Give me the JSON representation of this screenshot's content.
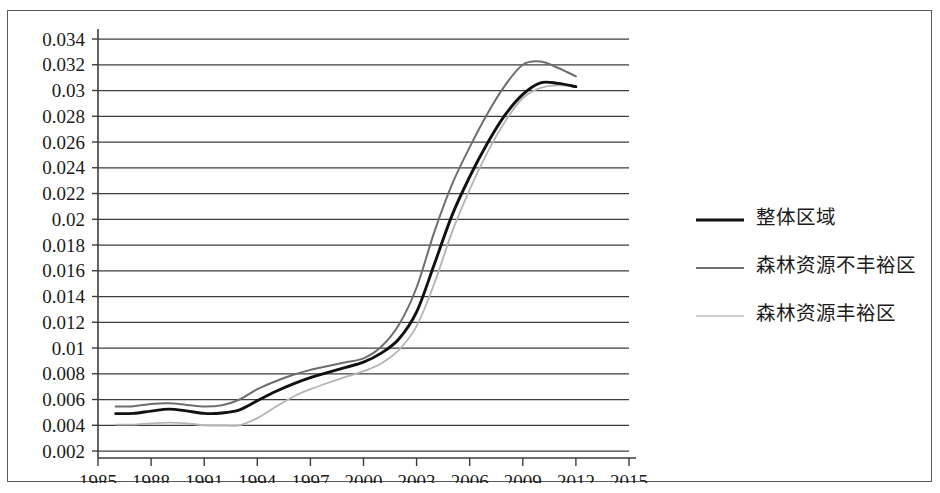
{
  "chart_data": {
    "type": "line",
    "title": "",
    "subtitle": "",
    "xlabel": "",
    "ylabel": "",
    "xlim": [
      1985,
      2015
    ],
    "ylim": [
      0.002,
      0.034
    ],
    "grid": true,
    "grid_axis": "y",
    "legend_position": "right",
    "x_tick_labels": [
      "1985",
      "1988",
      "1991",
      "1994",
      "1997",
      "2000",
      "2003",
      "2006",
      "2009",
      "2012",
      "2015"
    ],
    "x_ticks": [
      1985,
      1988,
      1991,
      1994,
      1997,
      2000,
      2003,
      2006,
      2009,
      2012,
      2015
    ],
    "y_tick_labels": [
      "0.034",
      "0.032",
      "0.03",
      "0.028",
      "0.026",
      "0.024",
      "0.022",
      "0.02",
      "0.018",
      "0.016",
      "0.014",
      "0.012",
      "0.01",
      "0.008",
      "0.006",
      "0.004",
      "0.002"
    ],
    "y_ticks": [
      0.034,
      0.032,
      0.03,
      0.028,
      0.026,
      0.024,
      0.022,
      0.02,
      0.018,
      0.016,
      0.014,
      0.012,
      0.01,
      0.008,
      0.006,
      0.004,
      0.002
    ],
    "x": [
      1986,
      1987,
      1988,
      1989,
      1990,
      1991,
      1992,
      1993,
      1994,
      1995,
      1996,
      1997,
      1998,
      1999,
      2000,
      2001,
      2002,
      2003,
      2004,
      2005,
      2006,
      2007,
      2008,
      2009,
      2010,
      2011,
      2012
    ],
    "series": [
      {
        "name": "整体区域",
        "color": "#111111",
        "width": 2.9,
        "dash": "none",
        "values": [
          0.0049,
          0.00492,
          0.0051,
          0.00525,
          0.00512,
          0.00492,
          0.00495,
          0.0052,
          0.0059,
          0.0066,
          0.0072,
          0.0077,
          0.0081,
          0.0085,
          0.0089,
          0.0096,
          0.0107,
          0.0128,
          0.0165,
          0.0203,
          0.0233,
          0.0259,
          0.0281,
          0.0297,
          0.0306,
          0.03055,
          0.0303
        ]
      },
      {
        "name": "森林资源不丰裕区",
        "color": "#6e6e6e",
        "width": 2.0,
        "dash": "none",
        "values": [
          0.00545,
          0.00548,
          0.00565,
          0.0057,
          0.00558,
          0.00545,
          0.00555,
          0.006,
          0.0068,
          0.0074,
          0.0079,
          0.0083,
          0.0086,
          0.0089,
          0.0092,
          0.0101,
          0.0118,
          0.0147,
          0.019,
          0.0227,
          0.0256,
          0.0282,
          0.0304,
          0.032,
          0.03225,
          0.03175,
          0.0311
        ]
      },
      {
        "name": "森林资源丰裕区",
        "color": "#b4b4b4",
        "width": 1.8,
        "dash": "none",
        "values": [
          0.00405,
          0.00405,
          0.00415,
          0.0042,
          0.00415,
          0.004,
          0.00398,
          0.004,
          0.00455,
          0.0054,
          0.0062,
          0.0068,
          0.0073,
          0.00775,
          0.0082,
          0.0088,
          0.00985,
          0.0117,
          0.015,
          0.019,
          0.0223,
          0.0252,
          0.0276,
          0.0294,
          0.0302,
          0.0304,
          0.0303
        ]
      }
    ]
  },
  "legend": {
    "items": [
      {
        "label": "整体区域",
        "color": "#111111",
        "width": 3.1
      },
      {
        "label": "森林资源不丰裕区",
        "color": "#6e6e6e",
        "width": 2.1
      },
      {
        "label": "森林资源丰裕区",
        "color": "#bdbdbd",
        "width": 1.7
      }
    ]
  }
}
